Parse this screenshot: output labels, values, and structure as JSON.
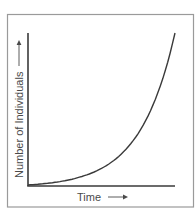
{
  "chart_data": {
    "type": "line",
    "title": "",
    "xlabel": "Time",
    "ylabel": "Number of Individuals",
    "xlabel_arrow": "→",
    "ylabel_arrow": "→",
    "x_ticks": [],
    "y_ticks": [],
    "grid": false,
    "legend": null,
    "series": [
      {
        "name": "population",
        "x": [
          0,
          0.2,
          0.4,
          0.55,
          0.7,
          0.8,
          0.88,
          0.93,
          0.97,
          1.0
        ],
        "y": [
          0,
          0.03,
          0.07,
          0.12,
          0.2,
          0.3,
          0.44,
          0.56,
          0.75,
          1.0
        ]
      }
    ],
    "xlim": [
      0,
      1
    ],
    "ylim": [
      0,
      1
    ]
  },
  "colors": {
    "background": "#ffffff",
    "frame": "#9a9a9a",
    "axis": "#3a3a3a",
    "curve": "#3a3a3a",
    "text": "#4a4a4a"
  }
}
